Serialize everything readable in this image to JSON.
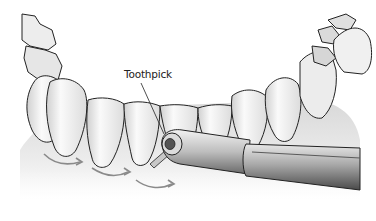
{
  "illustration": {
    "subject": "lower teeth with toothpick held in holder cleaning between teeth",
    "label": "Toothpick",
    "colors": {
      "outline": "#222222",
      "tooth_light": "#f4f4f4",
      "tooth_shade": "#c8c8c8",
      "gum": "#e2e2e2",
      "handle_dark": "#5a5a5a",
      "handle_mid": "#9a9a9a",
      "arrow": "#8a8a8a",
      "background": "#ffffff"
    }
  }
}
